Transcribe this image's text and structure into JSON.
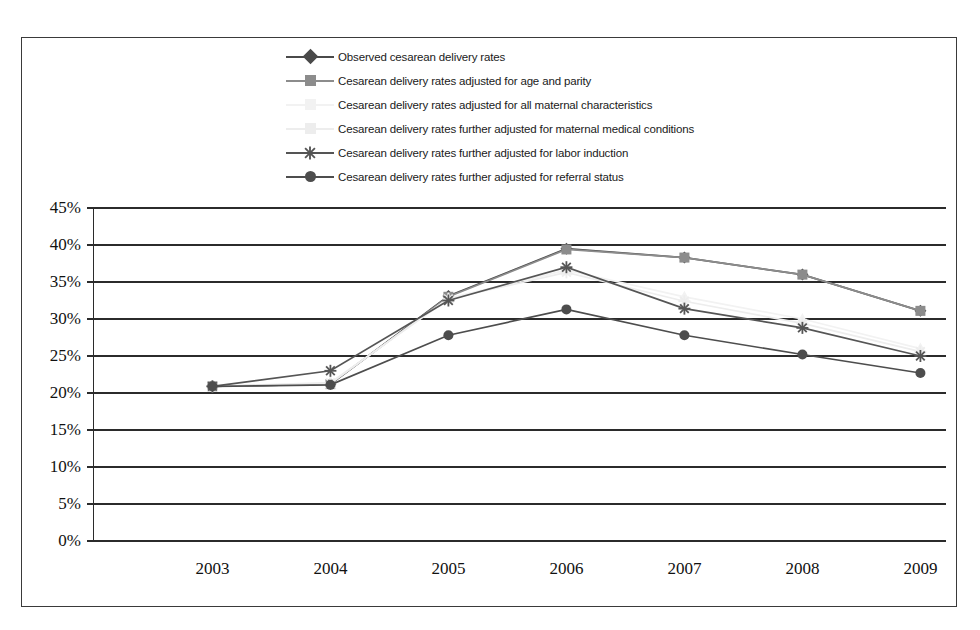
{
  "chart_data": {
    "type": "line",
    "title": "",
    "xlabel": "",
    "ylabel": "",
    "categories": [
      "2003",
      "2004",
      "2005",
      "2006",
      "2007",
      "2008",
      "2009"
    ],
    "x": [
      2003,
      2004,
      2005,
      2006,
      2007,
      2008,
      2009
    ],
    "ylim": [
      0,
      45
    ],
    "ytick_labels": [
      "0%",
      "5%",
      "10%",
      "15%",
      "20%",
      "25%",
      "30%",
      "35%",
      "40%",
      "45%"
    ],
    "ytick_values": [
      0,
      5,
      10,
      15,
      20,
      25,
      30,
      35,
      40,
      45
    ],
    "grid": true,
    "legend_position": "top",
    "unit": "%",
    "series": [
      {
        "name": "Observed cesarean delivery rates",
        "marker": "diamond",
        "color": "#4a4a4a",
        "line_color": "#4a4a4a",
        "values": [
          20.9,
          21.2,
          33.1,
          39.5,
          38.3,
          36.0,
          31.1
        ]
      },
      {
        "name": "Cesarean delivery rates adjusted for age and parity",
        "marker": "square",
        "color": "#8c8c8c",
        "line_color": "#8c8c8c",
        "values": [
          20.9,
          21.2,
          33.0,
          39.4,
          38.3,
          36.0,
          31.1
        ]
      },
      {
        "name": "Cesarean delivery rates adjusted for all maternal characteristics",
        "marker": "triangle",
        "color": "#f2f2f2",
        "line_color": "#f2f2f2",
        "values": [
          20.9,
          21.3,
          32.8,
          36.6,
          33.0,
          30.0,
          26.0
        ]
      },
      {
        "name": "Cesarean delivery rates further adjusted for maternal medical conditions",
        "marker": "cross",
        "color": "#ededed",
        "line_color": "#ededed",
        "values": [
          20.9,
          21.4,
          32.7,
          36.3,
          32.4,
          29.4,
          25.6
        ]
      },
      {
        "name": "Cesarean delivery rates further adjusted for labor induction",
        "marker": "star",
        "color": "#555555",
        "line_color": "#555555",
        "values": [
          20.9,
          23.0,
          32.5,
          37.0,
          31.4,
          28.8,
          25.0
        ]
      },
      {
        "name": "Cesarean delivery rates further adjusted for referral status",
        "marker": "circle",
        "color": "#4d4d4d",
        "line_color": "#4d4d4d",
        "values": [
          20.9,
          21.1,
          27.8,
          31.3,
          27.8,
          25.2,
          22.7
        ]
      }
    ]
  },
  "colors": {
    "axis": "#2b2b2b",
    "frame": "#3a3a3a",
    "text": "#111111",
    "background": "#ffffff"
  }
}
